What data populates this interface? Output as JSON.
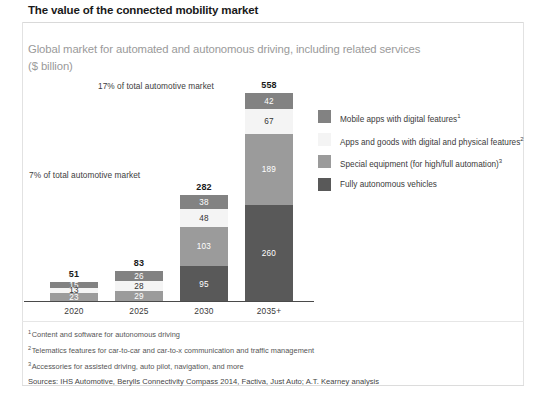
{
  "headline": "The value of the connected mobility market",
  "subtitle": {
    "line1": "Global market for automated and autonomous driving, including related services",
    "line2": "($ billion)"
  },
  "annotations": {
    "upper": "17% of total automotive market",
    "lower": "7% of total automotive market"
  },
  "legend": {
    "items": [
      {
        "label": "Mobile apps with digital features",
        "sup": "1",
        "color": "#828282",
        "key": "mobile-apps"
      },
      {
        "label": "Apps and goods with digital and physical features",
        "sup": "2",
        "color": "#f4f4f4",
        "key": "apps-and-goods"
      },
      {
        "label": "Special equipment (for high/full automation)",
        "sup": "3",
        "color": "#9b9b9b",
        "key": "special-equipment"
      },
      {
        "label": "Fully autonomous vehicles",
        "sup": "",
        "color": "#595959",
        "key": "fully-autonomous"
      }
    ]
  },
  "footnotes": [
    {
      "sup": "1",
      "text": "Content and software for autonomous driving"
    },
    {
      "sup": "2",
      "text": "Telematics features for car-to-car and car-to-x communication and traffic management"
    },
    {
      "sup": "3",
      "text": "Accessories for assisted driving, auto pilot, navigation, and more"
    }
  ],
  "sources": "Sources: IHS Automotive, Berylls Connectivity Compass 2014, Factiva, Just Auto; A.T. Kearney analysis",
  "chart_data": {
    "type": "bar",
    "subtype": "stacked",
    "title": "Global market for automated and autonomous driving, including related services",
    "xlabel": "",
    "ylabel": "$ billion",
    "ylim": [
      0,
      558
    ],
    "grid": false,
    "legend_position": "right",
    "categories": [
      "2020",
      "2025",
      "2030",
      "2035+"
    ],
    "totals": [
      51,
      83,
      282,
      558
    ],
    "series": [
      {
        "name": "Fully autonomous vehicles",
        "color": "#595959",
        "values": [
          0,
          0,
          95,
          260
        ]
      },
      {
        "name": "Special equipment (for high/full automation)",
        "color": "#9b9b9b",
        "values": [
          23,
          29,
          103,
          189
        ]
      },
      {
        "name": "Apps and goods with digital and physical features",
        "color": "#f4f4f4",
        "values": [
          13,
          28,
          48,
          67
        ]
      },
      {
        "name": "Mobile apps with digital features",
        "color": "#828282",
        "values": [
          15,
          26,
          38,
          42
        ]
      }
    ],
    "annotations": [
      {
        "text": "7% of total automotive market",
        "near": "2020"
      },
      {
        "text": "17% of total automotive market",
        "near": "2035+"
      }
    ]
  },
  "bars": [
    {
      "category": "2020",
      "total": "51",
      "segments": [
        {
          "value": "15",
          "style": "medgry"
        },
        {
          "value": "13",
          "style": "light"
        },
        {
          "value": "23",
          "style": "mid"
        }
      ]
    },
    {
      "category": "2025",
      "total": "83",
      "segments": [
        {
          "value": "26",
          "style": "medgry"
        },
        {
          "value": "28",
          "style": "light"
        },
        {
          "value": "29",
          "style": "mid"
        }
      ]
    },
    {
      "category": "2030",
      "total": "282",
      "segments": [
        {
          "value": "38",
          "style": "medgry"
        },
        {
          "value": "48",
          "style": "light"
        },
        {
          "value": "103",
          "style": "mid"
        },
        {
          "value": "95",
          "style": "dark"
        }
      ]
    },
    {
      "category": "2035+",
      "total": "558",
      "segments": [
        {
          "value": "42",
          "style": "medgry"
        },
        {
          "value": "67",
          "style": "light"
        },
        {
          "value": "189",
          "style": "mid"
        },
        {
          "value": "260",
          "style": "dark"
        }
      ]
    }
  ]
}
